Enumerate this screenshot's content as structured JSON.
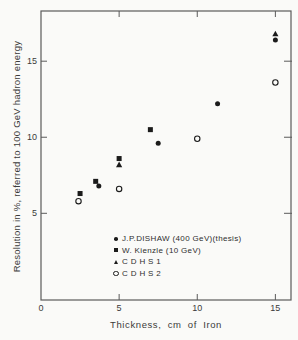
{
  "chart_data": {
    "type": "scatter",
    "title": "",
    "xlabel": "Thickness, cm of Iron",
    "ylabel": "Resolution in %, referred to 100 GeV hadron energy",
    "x_axis": {
      "range": [
        0,
        16
      ],
      "ticks": [
        0,
        5,
        10,
        15
      ],
      "tick_labels": [
        "0",
        "5",
        "10",
        "15"
      ]
    },
    "y_axis": {
      "range": [
        -0.7,
        18.3
      ],
      "ticks": [
        5,
        10,
        15
      ],
      "tick_labels": [
        "5",
        "10",
        "15"
      ]
    },
    "grid": false,
    "legend_position": "inside bottom-center",
    "series": [
      {
        "name": "J.P.DISHAW (400 GeV)(thesis)",
        "marker": "filled-circle",
        "points": [
          [
            3.7,
            6.8
          ],
          [
            7.5,
            9.6
          ],
          [
            11.3,
            12.2
          ],
          [
            15.0,
            16.4
          ]
        ]
      },
      {
        "name": "W. Kienzle (10 GeV)",
        "marker": "filled-square",
        "points": [
          [
            2.5,
            6.3
          ],
          [
            3.5,
            7.1
          ],
          [
            5.0,
            8.6
          ],
          [
            7.0,
            10.5
          ]
        ]
      },
      {
        "name": "C D H S 1",
        "marker": "filled-triangle",
        "points": [
          [
            5.0,
            8.2
          ],
          [
            15.0,
            16.8
          ]
        ]
      },
      {
        "name": "C D H S 2",
        "marker": "open-circle",
        "points": [
          [
            2.4,
            5.8
          ],
          [
            5.0,
            6.6
          ],
          [
            10.0,
            9.9
          ],
          [
            15.0,
            13.6
          ]
        ]
      }
    ],
    "colors": {
      "ink": "#1b1b1b",
      "frame": "#5a5a5a",
      "text": "#3a3a3a",
      "background": "#fafaf8"
    }
  }
}
